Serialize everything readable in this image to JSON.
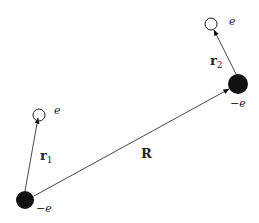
{
  "diagram": {
    "type": "physics-vector-diagram",
    "colors": {
      "ink": "#111111",
      "line": "#333333",
      "background": "#ffffff"
    },
    "nuclei": [
      {
        "id": "nucleus-1",
        "cx": 25,
        "cy": 200,
        "r": 9,
        "label": "−e",
        "label_x": 36,
        "label_y": 212
      },
      {
        "id": "nucleus-2",
        "cx": 238,
        "cy": 84,
        "r": 10,
        "label": "−e",
        "label_x": 230,
        "label_y": 107
      }
    ],
    "electrons": [
      {
        "id": "electron-1",
        "cx": 39,
        "cy": 115,
        "r": 6,
        "label": "e",
        "label_x": 54,
        "label_y": 114
      },
      {
        "id": "electron-2",
        "cx": 211,
        "cy": 24,
        "r": 6,
        "label": "e",
        "label_x": 229,
        "label_y": 25
      }
    ],
    "vectors": [
      {
        "id": "r1",
        "from": [
          25,
          191
        ],
        "to": [
          38,
          118
        ],
        "label": "r",
        "subscript": "1",
        "label_x": 40,
        "label_y": 160
      },
      {
        "id": "r2",
        "from": [
          236,
          74
        ],
        "to": [
          214,
          30
        ],
        "label": "r",
        "subscript": "2",
        "label_x": 210,
        "label_y": 65
      },
      {
        "id": "R",
        "from": [
          34,
          196
        ],
        "to": [
          229,
          89
        ],
        "label": "R",
        "label_x": 141,
        "label_y": 158
      }
    ]
  }
}
